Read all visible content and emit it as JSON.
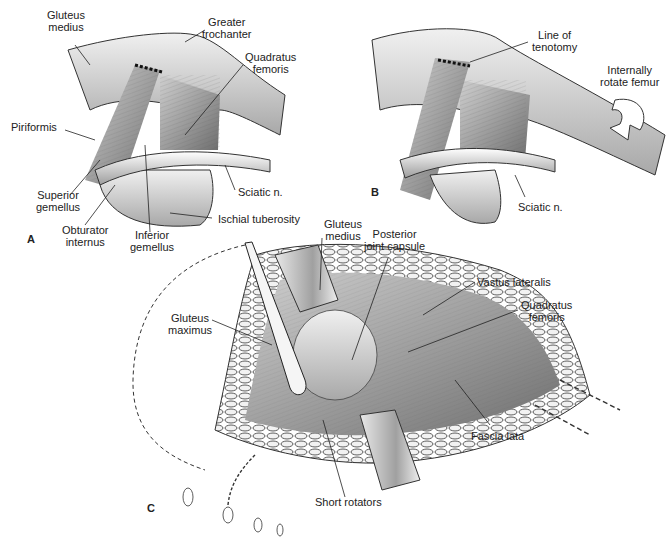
{
  "figure": {
    "panels": [
      {
        "id": "A",
        "letter": "A",
        "labels": {
          "gluteus_medius": "Gluteus\nmedius",
          "greater_trochanter": "Greater\ntrochanter",
          "quadratus_femoris": "Quadratus\nfemoris",
          "piriformis": "Piriformis",
          "superior_gemellus": "Superior\ngemellus",
          "obturator_internus": "Obturator\ninternus",
          "inferior_gemellus": "Inferior\ngemellus",
          "sciatic_n": "Sciatic n.",
          "ischial_tuberosity": "Ischial tuberosity"
        }
      },
      {
        "id": "B",
        "letter": "B",
        "labels": {
          "line_of_tenotomy": "Line of\ntenotomy",
          "internally_rotate_femur": "Internally\nrotate femur",
          "sciatic_n": "Sciatic n."
        }
      },
      {
        "id": "C",
        "letter": "C",
        "labels": {
          "gluteus_medius": "Gluteus\nmedius",
          "posterior_joint_capsule": "Posterior\njoint capsule",
          "vastus_lateralis": "Vastus lateralis",
          "quadratus_femoris": "Quadratus\nfemoris",
          "gluteus_maximus": "Gluteus\nmaximus",
          "fascia_lata": "Fascia lata",
          "short_rotators": "Short rotators"
        }
      }
    ],
    "colors": {
      "background": "#ffffff",
      "bone": "#d9d9d9",
      "muscle": "#9a9a9a",
      "dark_line": "#222222",
      "retractor": "#bdbdbd"
    }
  }
}
